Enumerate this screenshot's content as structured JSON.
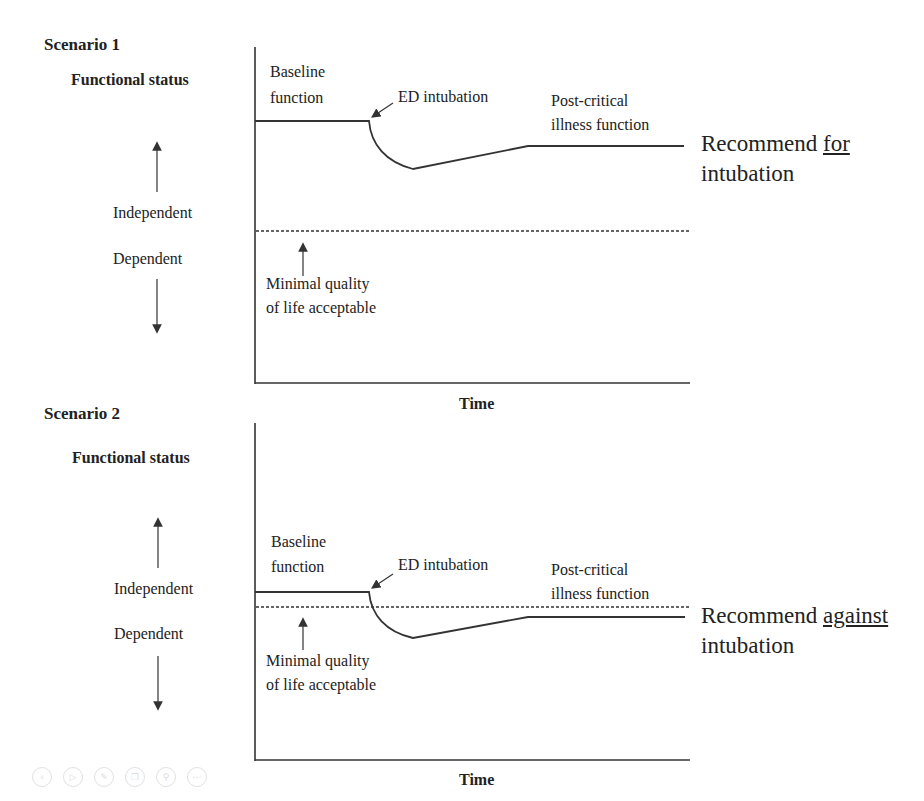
{
  "figure": {
    "scenario1": {
      "title": "Scenario 1",
      "y_axis_label": "Functional status",
      "up_label": "Independent",
      "down_label": "Dependent",
      "x_axis_label": "Time",
      "baseline_label_line1": "Baseline",
      "baseline_label_line2": "function",
      "event_label": "ED intubation",
      "post_label_line1": "Post-critical",
      "post_label_line2": "illness function",
      "threshold_label_line1": "Minimal quality",
      "threshold_label_line2": "of life acceptable",
      "recommendation_prefix": "Recommend ",
      "recommendation_emphasis": "for",
      "recommendation_line2": "intubation"
    },
    "scenario2": {
      "title": "Scenario 2",
      "y_axis_label": "Functional status",
      "up_label": "Independent",
      "down_label": "Dependent",
      "x_axis_label": "Time",
      "baseline_label_line1": "Baseline",
      "baseline_label_line2": "function",
      "event_label": "ED intubation",
      "post_label_line1": "Post-critical",
      "post_label_line2": "illness function",
      "threshold_label_line1": "Minimal quality",
      "threshold_label_line2": "of life acceptable",
      "recommendation_prefix": "Recommend ",
      "recommendation_emphasis": "against",
      "recommendation_line2": "intubation"
    }
  },
  "toolbar": {
    "icons": [
      "back-icon",
      "play-icon",
      "pen-icon",
      "copy-icon",
      "zoom-icon",
      "more-icon"
    ]
  },
  "colors": {
    "line": "#333333",
    "text": "#222222",
    "background": "#ffffff"
  }
}
